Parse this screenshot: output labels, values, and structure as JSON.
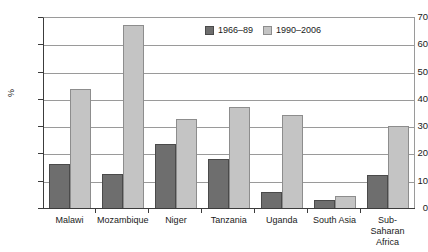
{
  "chart_data": {
    "type": "bar",
    "title": "",
    "xlabel": "",
    "ylabel": "%",
    "ylim": [
      0,
      70
    ],
    "yticks": [
      0,
      10,
      20,
      30,
      40,
      50,
      60,
      70
    ],
    "grid": true,
    "legend_position": "top-center",
    "categories": [
      "Malawi",
      "Mozambique",
      "Niger",
      "Tanzania",
      "Uganda",
      "South Asia",
      "Sub-Saharan Africa"
    ],
    "series": [
      {
        "name": "1966–89",
        "color": "#6e6e6e",
        "values": [
          16,
          12.5,
          23.5,
          18,
          6,
          3,
          12
        ]
      },
      {
        "name": "1990–2006",
        "color": "#c4c4c4",
        "values": [
          43.5,
          67,
          32.5,
          37,
          34,
          4.5,
          30
        ]
      }
    ]
  },
  "colors": {
    "series_a": "#6e6e6e",
    "series_b": "#c4c4c4",
    "axis": "#3c3c3c",
    "grid": "#9a9a9a",
    "background": "#ffffff",
    "text": "#1a1a1a"
  },
  "axis": {
    "y_title": "%",
    "y_tick_labels": [
      "70",
      "60",
      "50",
      "40",
      "30",
      "20",
      "10",
      "0"
    ]
  },
  "legend": {
    "items": [
      {
        "label": "1966–89"
      },
      {
        "label": "1990–2006"
      }
    ]
  },
  "x_labels": [
    "Malawi",
    "Mozambique",
    "Niger",
    "Tanzania",
    "Uganda",
    "South Asia",
    "Sub-Saharan Africa"
  ]
}
